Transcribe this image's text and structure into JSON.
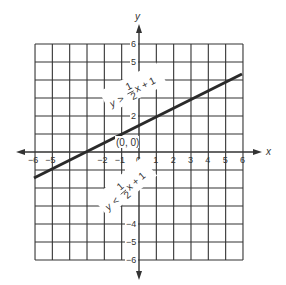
{
  "chart_data": {
    "type": "line",
    "title": "",
    "xlabel": "x",
    "ylabel": "y",
    "xlim": [
      -6,
      6
    ],
    "ylim": [
      -6,
      6
    ],
    "grid": true,
    "x_ticks": [
      "−6",
      "−5",
      "−2",
      "−1",
      "0",
      "1",
      "2",
      "3",
      "4",
      "5",
      "6"
    ],
    "y_ticks": [
      "6",
      "5",
      "2",
      "−1",
      "−2",
      "−4",
      "−5",
      "−6"
    ],
    "series": [
      {
        "name": "y = ½x + 1",
        "equation": "y = 1/2 x + 1",
        "x": [
          -6,
          6
        ],
        "y": [
          -2,
          4
        ]
      }
    ],
    "annotations": [
      {
        "text": "(0, 0)",
        "position": "origin"
      },
      {
        "text": "y > ½x + 1",
        "region": "above line"
      },
      {
        "text": "y < ½x + 1",
        "region": "below line"
      }
    ]
  },
  "labels": {
    "x_axis": "x",
    "y_axis": "y",
    "origin": "(0, 0)",
    "above": {
      "y": "y",
      "op": ">",
      "num": "1",
      "den": "2",
      "rest": "x + 1"
    },
    "below": {
      "y": "y",
      "op": "<",
      "num": "1",
      "den": "2",
      "rest": "x + 1"
    }
  }
}
